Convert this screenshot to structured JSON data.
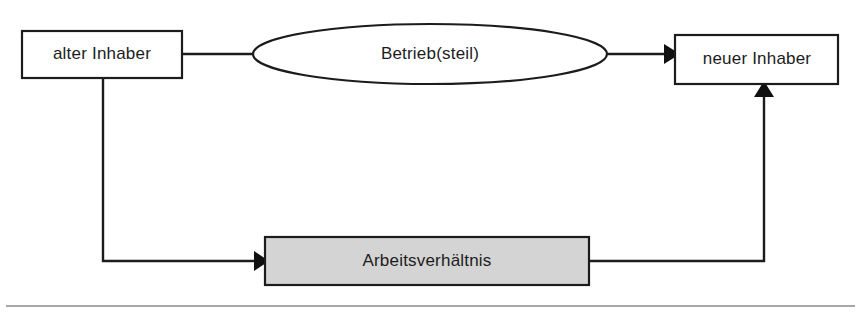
{
  "diagram": {
    "colors": {
      "stroke": "#1c1c1c",
      "text": "#1c1c1c",
      "node_fill_white": "#ffffff",
      "node_fill_gray": "#d4d4d4",
      "rule": "#8a8a8a",
      "background": "#ffffff"
    },
    "nodes": [
      {
        "id": "alter-inhaber",
        "label": "alter Inhaber",
        "shape": "rectangle",
        "fill": "#ffffff",
        "x": 22,
        "y": 31,
        "width": 160,
        "height": 47
      },
      {
        "id": "betrieb-steil",
        "label": "Betrieb(steil)",
        "shape": "ellipse",
        "fill": "#ffffff",
        "cx": 430,
        "cy": 54,
        "rx": 177,
        "ry": 30
      },
      {
        "id": "neuer-inhaber",
        "label": "neuer Inhaber",
        "shape": "rectangle",
        "fill": "#ffffff",
        "x": 675,
        "y": 35,
        "width": 163,
        "height": 49
      },
      {
        "id": "arbeitsverhaeltnis",
        "label": "Arbeitsverhältnis",
        "shape": "rectangle",
        "fill": "#d4d4d4",
        "x": 265,
        "y": 237,
        "width": 324,
        "height": 48
      }
    ],
    "connectors": [
      {
        "id": "alter-inhaber-to-betrieb",
        "from": "alter-inhaber",
        "to": "betrieb-steil",
        "arrow": false,
        "path": "M 182 54 L 253 54"
      },
      {
        "id": "betrieb-to-neuer-inhaber",
        "from": "betrieb-steil",
        "to": "neuer-inhaber",
        "arrow": true,
        "arrow_direction": "right",
        "path": "M 607 54 L 666 54"
      },
      {
        "id": "alter-inhaber-to-arbeitsverhaeltnis",
        "from": "alter-inhaber",
        "to": "arbeitsverhaeltnis",
        "arrow": true,
        "arrow_direction": "right",
        "path": "M 103 78 L 103 261 L 256 261"
      },
      {
        "id": "arbeitsverhaeltnis-to-neuer-inhaber",
        "from": "arbeitsverhaeltnis",
        "to": "neuer-inhaber",
        "arrow": true,
        "arrow_direction": "up",
        "path": "M 589 261 L 764 261 L 764 93"
      }
    ],
    "footer_rule": {
      "label": "horizontal-divider",
      "x1": 6,
      "y1": 306,
      "x2": 855,
      "y2": 306
    }
  }
}
